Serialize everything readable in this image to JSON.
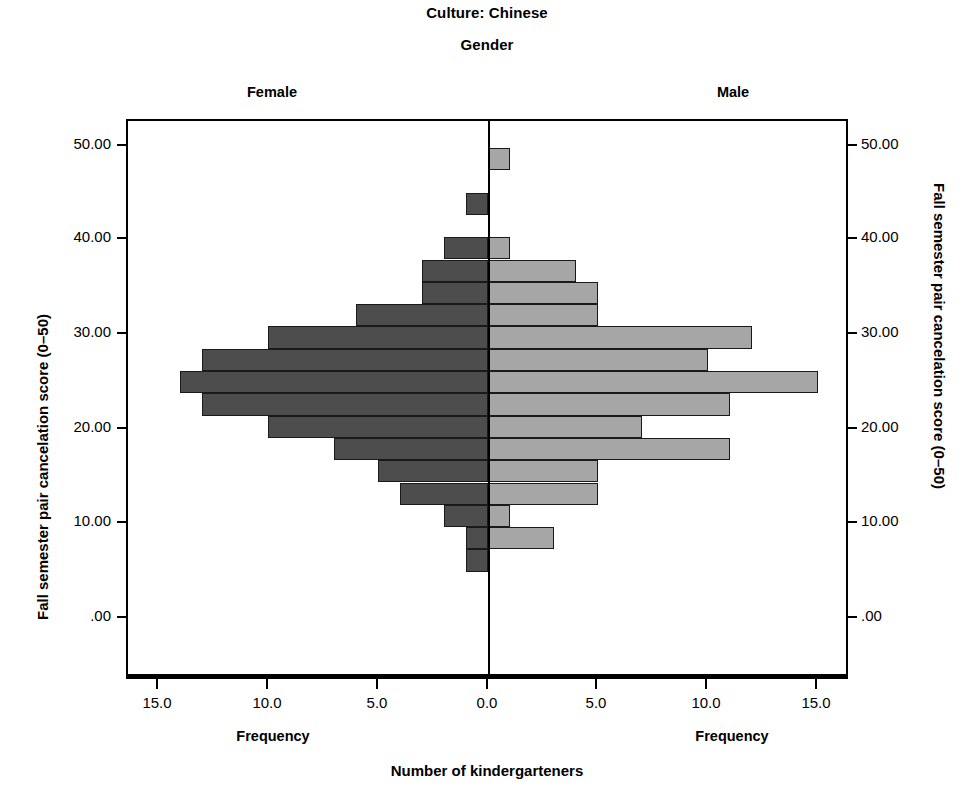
{
  "titles": {
    "culture": "Culture: Chinese",
    "gender": "Gender",
    "female_panel": "Female",
    "male_panel": "Male"
  },
  "axes": {
    "y_title_left": "Fall semester pair cancelation score (0–50)",
    "y_title_right": "Fall semester pair cancelation score (0–50)",
    "x_title": "Number of kindergarteners",
    "x_caption_left": "Frequency",
    "x_caption_right": "Frequency",
    "y_ticklabels": [
      "50.00",
      "40.00",
      "30.00",
      "20.00",
      "10.00",
      ".00"
    ],
    "x_ticklabels": [
      "15.0",
      "10.0",
      "5.0",
      "0.0",
      "5.0",
      "10.0",
      "15.0"
    ]
  },
  "colors": {
    "female_bar": "#4d4d4d",
    "male_bar": "#a6a6a6",
    "outline": "#1a1a1a",
    "axis": "#000000",
    "background": "#ffffff"
  },
  "chart_data": {
    "type": "bar",
    "subtype": "population-pyramid-histogram",
    "title": "Culture: Chinese",
    "subtitle": "Gender",
    "xlabel": "Number of kindergarteners",
    "ylabel": "Fall semester pair cancelation score (0–50)",
    "xlim": [
      -16.4,
      16.4
    ],
    "ylim": [
      0,
      52
    ],
    "grid": false,
    "legend": "panel-headers",
    "bin_width": 2.33,
    "bin_centers": [
      48.8,
      46.5,
      44.2,
      41.8,
      39.5,
      37.2,
      34.9,
      32.5,
      30.2,
      27.9,
      25.6,
      23.2,
      20.9,
      18.6,
      16.3,
      13.9,
      11.6,
      9.3,
      7.0
    ],
    "series": [
      {
        "name": "Female",
        "direction": "left",
        "values": [
          0,
          0,
          1,
          0,
          2,
          3,
          3,
          6,
          10,
          13,
          14,
          13,
          10,
          7,
          5,
          4,
          2,
          1,
          1
        ]
      },
      {
        "name": "Male",
        "direction": "right",
        "values": [
          1,
          0,
          0,
          0,
          1,
          4,
          5,
          5,
          12,
          10,
          15,
          11,
          7,
          11,
          5,
          5,
          1,
          3,
          0
        ]
      }
    ]
  }
}
